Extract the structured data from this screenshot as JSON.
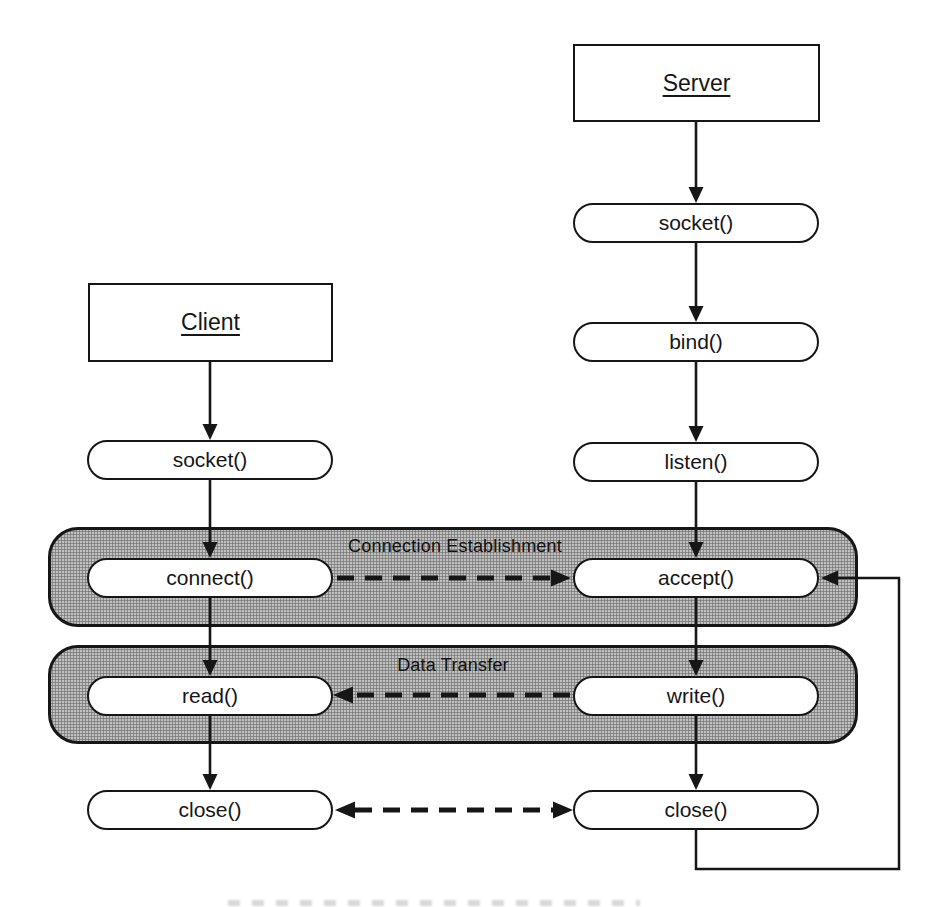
{
  "client": {
    "title": "Client",
    "socket": "socket()",
    "connect": "connect()",
    "read": "read()",
    "close": "close()"
  },
  "server": {
    "title": "Server",
    "socket": "socket()",
    "bind": "bind()",
    "listen": "listen()",
    "accept": "accept()",
    "write": "write()",
    "close": "close()"
  },
  "bands": {
    "connection": "Connection Establishment",
    "data": "Data Transfer"
  },
  "colors": {
    "line": "#161616",
    "band_fill": "#c0c0c0",
    "band_dot": "#777777",
    "node_fill": "#ffffff",
    "background": "#ffffff"
  }
}
